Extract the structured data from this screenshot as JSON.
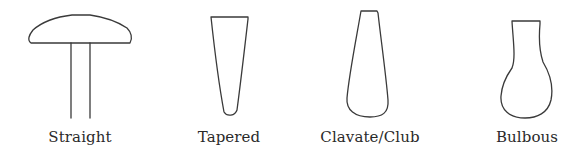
{
  "figure": {
    "title": "",
    "items": [
      {
        "label": "Straight",
        "shape": "straight-icon"
      },
      {
        "label": "Tapered",
        "shape": "tapered-icon"
      },
      {
        "label": "Clavate/Club",
        "shape": "clavate-club-icon"
      },
      {
        "label": "Bulbous",
        "shape": "bulbous-icon"
      }
    ],
    "stroke_color": "#3a3a3a",
    "background": "#ffffff"
  }
}
